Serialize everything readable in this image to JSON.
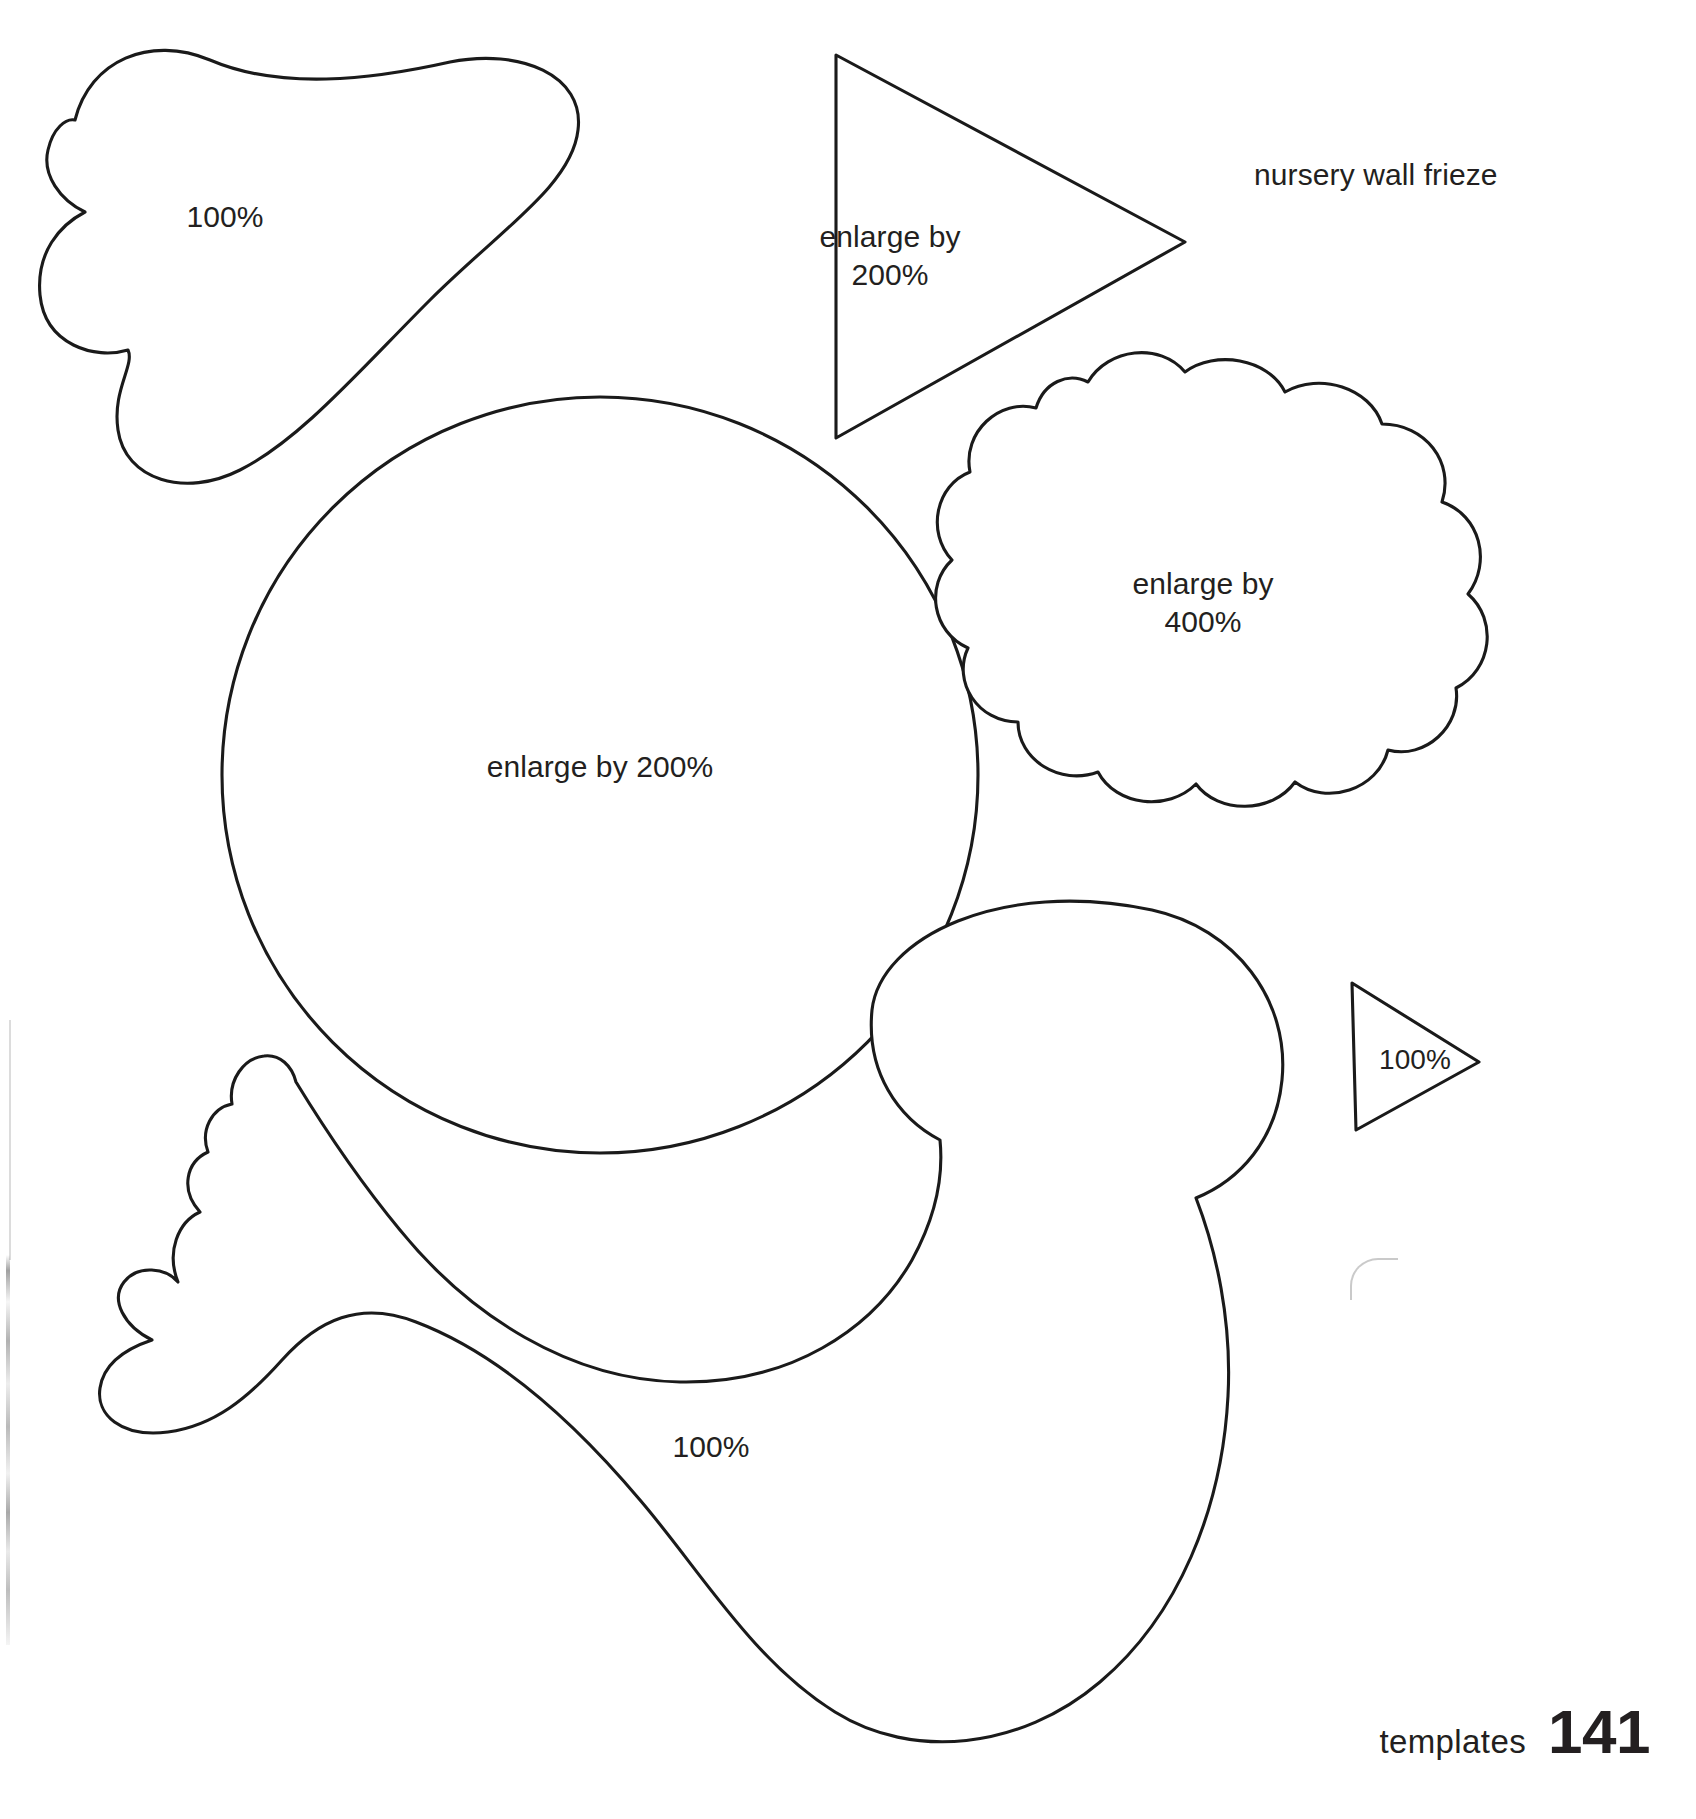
{
  "page": {
    "caption": "nursery wall frieze",
    "footer": {
      "label": "templates",
      "number": "141"
    },
    "ink_color": "#1a1a1a",
    "background_color": "#ffffff"
  },
  "templates": [
    {
      "id": "wing-shape",
      "name": "wing",
      "scale_label": "100%"
    },
    {
      "id": "beak-triangle",
      "name": "beak",
      "scale_label": "enlarge by\n200%"
    },
    {
      "id": "body-circle",
      "name": "body circle",
      "scale_label": "enlarge by 200%"
    },
    {
      "id": "cloud-shape",
      "name": "cloud",
      "scale_label": "enlarge by\n400%"
    },
    {
      "id": "small-beak-triangle",
      "name": "small beak",
      "scale_label": "100%"
    },
    {
      "id": "duck-body",
      "name": "duck body",
      "scale_label": "100%"
    }
  ]
}
